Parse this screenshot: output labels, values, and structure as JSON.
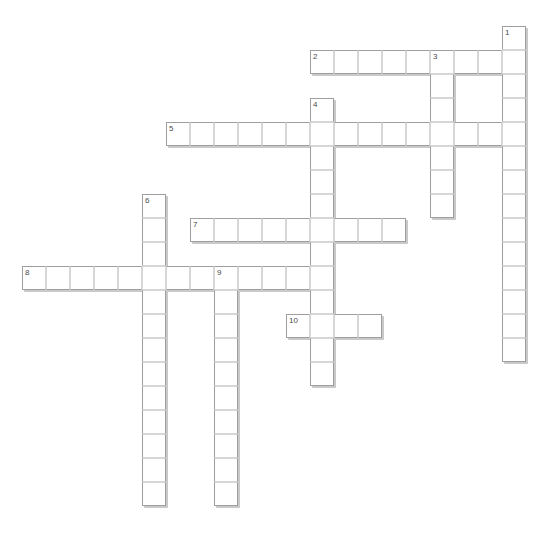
{
  "puzzle": {
    "title": "Crossword Puzzle Grid",
    "cell_size": 24,
    "origin_x": 22,
    "origin_y": 26,
    "columns": 21,
    "rows": 20,
    "colors": {
      "background": "#ffffff",
      "cell_fill": "#ffffff",
      "cell_inner_border": "#d6d6d6",
      "entry_outline": "#9e9e9e",
      "shadow": "#c9c9c9",
      "number_text": "#4a4a4a"
    },
    "entry_count": 10,
    "across_count": 5,
    "down_count": 5,
    "entries": [
      {
        "number": "1",
        "direction": "down",
        "row": 0,
        "col": 20,
        "length": 14
      },
      {
        "number": "2",
        "direction": "across",
        "row": 1,
        "col": 12,
        "length": 9
      },
      {
        "number": "3",
        "direction": "down",
        "row": 1,
        "col": 17,
        "length": 7
      },
      {
        "number": "4",
        "direction": "down",
        "row": 3,
        "col": 12,
        "length": 12
      },
      {
        "number": "5",
        "direction": "across",
        "row": 4,
        "col": 6,
        "length": 14
      },
      {
        "number": "6",
        "direction": "down",
        "row": 7,
        "col": 5,
        "length": 13
      },
      {
        "number": "7",
        "direction": "across",
        "row": 8,
        "col": 7,
        "length": 9
      },
      {
        "number": "8",
        "direction": "across",
        "row": 10,
        "col": 0,
        "length": 12
      },
      {
        "number": "9",
        "direction": "down",
        "row": 10,
        "col": 8,
        "length": 10
      },
      {
        "number": "10",
        "direction": "across",
        "row": 12,
        "col": 11,
        "length": 4
      }
    ],
    "numbered_cells": [
      {
        "label": "1",
        "row": 0,
        "col": 20
      },
      {
        "label": "2",
        "row": 1,
        "col": 12
      },
      {
        "label": "3",
        "row": 1,
        "col": 17
      },
      {
        "label": "4",
        "row": 3,
        "col": 12
      },
      {
        "label": "5",
        "row": 4,
        "col": 6
      },
      {
        "label": "6",
        "row": 7,
        "col": 5
      },
      {
        "label": "7",
        "row": 8,
        "col": 7
      },
      {
        "label": "8",
        "row": 10,
        "col": 0
      },
      {
        "label": "9",
        "row": 10,
        "col": 8
      },
      {
        "label": "10",
        "row": 12,
        "col": 11
      }
    ]
  }
}
